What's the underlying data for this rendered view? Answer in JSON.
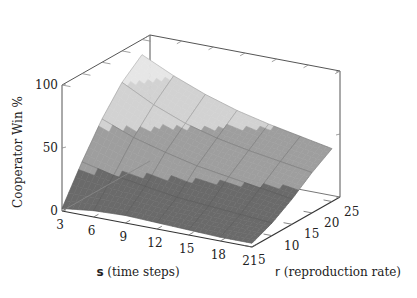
{
  "chart_data": {
    "type": "surface3d",
    "title": "",
    "xlabel": "s (time steps)",
    "ylabel": "r (reproduction rate)",
    "zlabel": "Cooperator Win %",
    "x_ticks": [
      3,
      6,
      9,
      12,
      15,
      18,
      21
    ],
    "y_ticks": [
      5,
      10,
      15,
      20,
      25
    ],
    "z_ticks": [
      0,
      50,
      100
    ],
    "xlim": [
      3,
      21
    ],
    "ylim": [
      5,
      27
    ],
    "zlim": [
      0,
      100
    ],
    "x": [
      3,
      6,
      9,
      12,
      15,
      18,
      21
    ],
    "y": [
      5,
      10,
      15,
      20,
      25
    ],
    "z": [
      [
        2,
        5,
        6,
        5,
        4,
        3,
        3
      ],
      [
        30,
        24,
        20,
        16,
        14,
        12,
        10
      ],
      [
        55,
        45,
        38,
        32,
        28,
        24,
        20
      ],
      [
        75,
        62,
        52,
        45,
        40,
        36,
        32
      ],
      [
        88,
        76,
        66,
        58,
        52,
        47,
        42
      ]
    ],
    "band_levels": [
      25,
      50,
      75
    ],
    "band_colors": [
      "#6a6a6a",
      "#9e9e9e",
      "#d2d2d2",
      "#e6e6e6"
    ],
    "grid": false,
    "legend": "none"
  },
  "labels": {
    "zlabel": "Cooperator Win %",
    "xlabel_bold": "s",
    "xlabel_rest": " (time steps)",
    "ylabel_bold": "r",
    "ylabel_rest": " (reproduction rate)"
  }
}
